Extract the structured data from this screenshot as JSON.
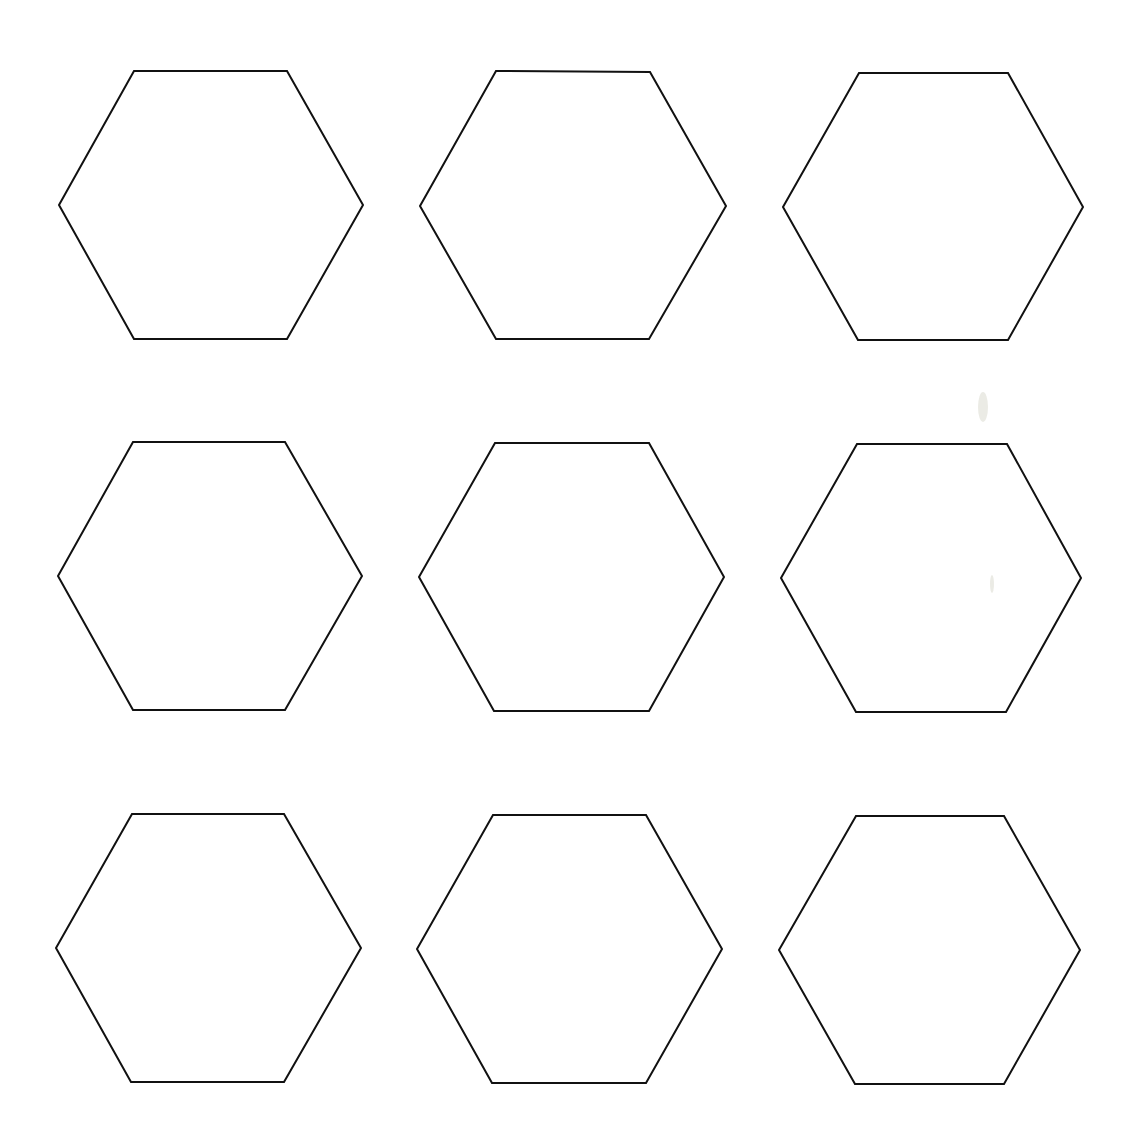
{
  "page": {
    "background": "#ffffff",
    "stroke_color": "#111111",
    "stroke_width": 2
  },
  "hexagons": [
    {
      "row": 0,
      "col": 0,
      "points": [
        [
          134,
          71
        ],
        [
          287,
          71
        ],
        [
          363,
          205
        ],
        [
          287,
          339
        ],
        [
          134,
          339
        ],
        [
          59,
          205
        ]
      ]
    },
    {
      "row": 0,
      "col": 1,
      "points": [
        [
          496,
          71
        ],
        [
          650,
          72
        ],
        [
          726,
          206
        ],
        [
          649,
          339
        ],
        [
          496,
          339
        ],
        [
          420,
          206
        ]
      ]
    },
    {
      "row": 0,
      "col": 2,
      "points": [
        [
          859,
          73
        ],
        [
          1008,
          73
        ],
        [
          1083,
          207
        ],
        [
          1008,
          340
        ],
        [
          858,
          340
        ],
        [
          783,
          207
        ]
      ]
    },
    {
      "row": 1,
      "col": 0,
      "points": [
        [
          133,
          442
        ],
        [
          285,
          442
        ],
        [
          362,
          576
        ],
        [
          285,
          710
        ],
        [
          133,
          710
        ],
        [
          58,
          576
        ]
      ]
    },
    {
      "row": 1,
      "col": 1,
      "points": [
        [
          495,
          443
        ],
        [
          649,
          443
        ],
        [
          724,
          577
        ],
        [
          649,
          711
        ],
        [
          494,
          711
        ],
        [
          419,
          577
        ]
      ]
    },
    {
      "row": 1,
      "col": 2,
      "points": [
        [
          857,
          444
        ],
        [
          1007,
          444
        ],
        [
          1081,
          578
        ],
        [
          1006,
          712
        ],
        [
          856,
          712
        ],
        [
          781,
          578
        ]
      ]
    },
    {
      "row": 2,
      "col": 0,
      "points": [
        [
          132,
          814
        ],
        [
          284,
          814
        ],
        [
          361,
          948
        ],
        [
          284,
          1082
        ],
        [
          131,
          1082
        ],
        [
          56,
          948
        ]
      ]
    },
    {
      "row": 2,
      "col": 1,
      "points": [
        [
          493,
          815
        ],
        [
          646,
          815
        ],
        [
          722,
          949
        ],
        [
          646,
          1083
        ],
        [
          492,
          1083
        ],
        [
          417,
          949
        ]
      ]
    },
    {
      "row": 2,
      "col": 2,
      "points": [
        [
          856,
          816
        ],
        [
          1004,
          816
        ],
        [
          1080,
          950
        ],
        [
          1004,
          1084
        ],
        [
          855,
          1084
        ],
        [
          779,
          950
        ]
      ]
    }
  ]
}
